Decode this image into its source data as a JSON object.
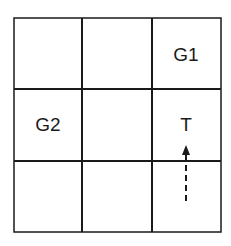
{
  "diagram": {
    "type": "grid-world",
    "rows": 3,
    "cols": 3,
    "cells": [
      {
        "row": 0,
        "col": 2,
        "label": "G1"
      },
      {
        "row": 1,
        "col": 0,
        "label": "G2"
      },
      {
        "row": 1,
        "col": 2,
        "label": "T"
      }
    ],
    "arrow": {
      "from": {
        "row": 2,
        "col": 2
      },
      "to": {
        "row": 1,
        "col": 2
      },
      "style": "dashed",
      "direction": "up"
    },
    "colors": {
      "line": "#1a1a1a",
      "background": "#ffffff"
    }
  }
}
